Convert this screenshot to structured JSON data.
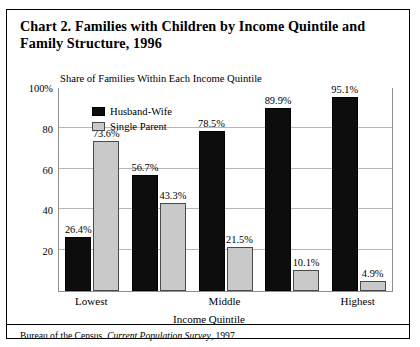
{
  "title": "Chart 2. Families with Children by Income Quintile and Family Structure, 1996",
  "subtitle": "Share of Families Within Each Income Quintile",
  "legend": {
    "husband_wife": "Husband-Wife",
    "single_parent": "Single Parent"
  },
  "axis": {
    "x_title": "Income Quintile",
    "y_ticks": [
      "100%",
      "80",
      "60",
      "40",
      "20"
    ]
  },
  "source": {
    "prefix": "Bureau of the Census. ",
    "italic": "Current Population Survey",
    "suffix": ", 1997."
  },
  "colors": {
    "husband_wife": "#0d0d0d",
    "single_parent": "#c9c9c9",
    "grid": "#b5b5b5",
    "frame": "#8e8e8e"
  },
  "chart_data": {
    "type": "bar",
    "title": "Chart 2. Families with Children by Income Quintile and Family Structure, 1996",
    "subtitle": "Share of Families Within Each Income Quintile",
    "xlabel": "Income Quintile",
    "ylabel": "",
    "ylim": [
      0,
      100
    ],
    "yticks": [
      20,
      40,
      60,
      80,
      100
    ],
    "grid": true,
    "legend_position": "top-left-inside",
    "categories": [
      "Lowest",
      "",
      "Middle",
      "",
      "Highest"
    ],
    "series": [
      {
        "name": "Husband-Wife",
        "color": "#0d0d0d",
        "values": [
          26.4,
          56.7,
          78.5,
          89.9,
          95.1
        ],
        "labels": [
          "26.4%",
          "56.7%",
          "78.5%",
          "89.9%",
          "95.1%"
        ]
      },
      {
        "name": "Single Parent",
        "color": "#c9c9c9",
        "values": [
          73.6,
          43.3,
          21.5,
          10.1,
          4.9
        ],
        "labels": [
          "73.6%",
          "43.3%",
          "21.5%",
          "10.1%",
          "4.9%"
        ]
      }
    ]
  }
}
